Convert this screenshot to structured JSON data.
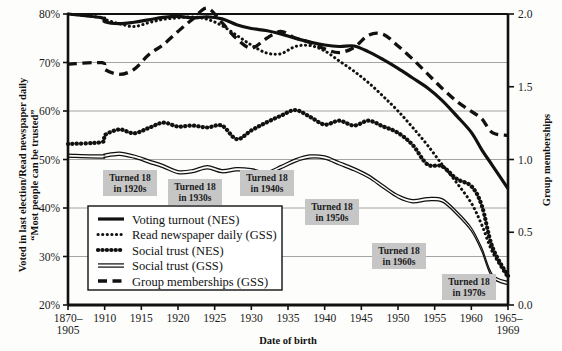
{
  "chart_data": {
    "type": "line",
    "title": "",
    "xlabel": "Date of birth",
    "ylabel": "Voted in last election/Read newspaper daily “Most people can be trusted”",
    "y2label": "Group memberships",
    "categories": [
      "1870–1905",
      "1910",
      "1915",
      "1920",
      "1925",
      "1930",
      "1935",
      "1940",
      "1945",
      "1950",
      "1955",
      "1960",
      "1965–1969"
    ],
    "x_tick_labels": [
      "1870–\n1905",
      "1910",
      "1915",
      "1920",
      "1925",
      "1930",
      "1935",
      "1940",
      "1945",
      "1950",
      "1955",
      "1960",
      "1965–\n1969"
    ],
    "y_tick_labels": [
      "20%",
      "30%",
      "40%",
      "50%",
      "60%",
      "70%",
      "80%"
    ],
    "y2_tick_labels": [
      "0.0",
      "0.5",
      "1.0",
      "1.5",
      "2.0"
    ],
    "ylim": [
      20,
      80
    ],
    "y2lim": [
      0.0,
      2.0
    ],
    "grid": true,
    "legend_position": "lower-left-inside",
    "series": [
      {
        "name": "Voting turnout (NES)",
        "axis": "left",
        "style": "solid-thick",
        "x": [
          1870,
          1907,
          1910,
          1912,
          1914,
          1916,
          1918,
          1920,
          1922,
          1924,
          1926,
          1928,
          1930,
          1932,
          1934,
          1936,
          1938,
          1940,
          1942,
          1944,
          1946,
          1948,
          1950,
          1952,
          1954,
          1956,
          1958,
          1960,
          1962,
          1964,
          1967
        ],
        "values": [
          80.0,
          79.2,
          78.4,
          78.0,
          78.3,
          78.8,
          79.3,
          79.5,
          79.2,
          79.4,
          79.0,
          77.8,
          77.0,
          76.6,
          75.9,
          75.0,
          74.2,
          73.6,
          73.3,
          73.4,
          72.2,
          70.6,
          68.8,
          66.8,
          64.8,
          62.2,
          59.0,
          55.6,
          52.0,
          48.8,
          44.0
        ]
      },
      {
        "name": "Read newspaper daily (GSS)",
        "axis": "left",
        "style": "dotted-fine",
        "x": [
          1870,
          1907,
          1910,
          1912,
          1914,
          1916,
          1918,
          1920,
          1922,
          1924,
          1926,
          1928,
          1930,
          1932,
          1934,
          1936,
          1938,
          1940,
          1942,
          1944,
          1946,
          1948,
          1950,
          1952,
          1954,
          1956,
          1958,
          1960,
          1962,
          1964,
          1967
        ],
        "values": [
          80.0,
          79.3,
          78.9,
          78.0,
          77.4,
          78.2,
          78.9,
          79.2,
          79.4,
          78.9,
          77.6,
          75.6,
          73.6,
          72.0,
          71.8,
          73.3,
          73.5,
          72.4,
          70.3,
          68.2,
          65.8,
          63.0,
          60.0,
          56.6,
          53.0,
          49.0,
          45.2,
          41.0,
          36.5,
          31.0,
          25.5
        ]
      },
      {
        "name": "Social trust (NES)",
        "axis": "left",
        "style": "dotted-thick",
        "x": [
          1870,
          1907,
          1910,
          1912,
          1914,
          1916,
          1918,
          1920,
          1922,
          1924,
          1926,
          1928,
          1930,
          1932,
          1934,
          1936,
          1938,
          1940,
          1942,
          1944,
          1946,
          1948,
          1950,
          1952,
          1954,
          1956,
          1958,
          1960,
          1962,
          1964,
          1967
        ],
        "values": [
          53.2,
          53.6,
          55.0,
          56.2,
          55.4,
          56.5,
          57.6,
          56.8,
          57.0,
          56.6,
          57.0,
          54.2,
          56.0,
          57.6,
          59.0,
          60.2,
          58.8,
          57.2,
          58.0,
          57.0,
          58.0,
          56.8,
          55.5,
          53.0,
          49.0,
          48.6,
          46.0,
          44.5,
          40.5,
          32.0,
          26.0
        ]
      },
      {
        "name": "Social trust (GSS)",
        "axis": "left",
        "style": "double-line",
        "x": [
          1870,
          1907,
          1910,
          1912,
          1914,
          1916,
          1918,
          1920,
          1922,
          1924,
          1926,
          1928,
          1930,
          1932,
          1934,
          1936,
          1938,
          1940,
          1942,
          1944,
          1946,
          1948,
          1950,
          1952,
          1954,
          1956,
          1958,
          1960,
          1962,
          1964,
          1967
        ],
        "values": [
          50.8,
          50.6,
          50.8,
          51.2,
          50.6,
          49.6,
          48.6,
          47.4,
          47.6,
          48.4,
          47.6,
          48.0,
          47.8,
          47.2,
          48.4,
          49.8,
          50.6,
          50.4,
          49.2,
          48.0,
          46.5,
          44.4,
          42.4,
          41.4,
          41.8,
          41.6,
          39.0,
          35.6,
          31.4,
          26.0,
          24.5
        ]
      },
      {
        "name": "Group memberships (GSS)",
        "axis": "right",
        "style": "dashed-thick",
        "x": [
          1870,
          1907,
          1910,
          1912,
          1914,
          1916,
          1918,
          1920,
          1922,
          1924,
          1926,
          1928,
          1930,
          1932,
          1934,
          1936,
          1938,
          1940,
          1942,
          1944,
          1946,
          1948,
          1950,
          1952,
          1954,
          1956,
          1958,
          1960,
          1962,
          1964,
          1967
        ],
        "values": [
          1.655,
          1.665,
          1.62,
          1.585,
          1.62,
          1.72,
          1.79,
          1.88,
          1.965,
          2.04,
          1.94,
          1.83,
          1.765,
          1.83,
          1.88,
          1.835,
          1.805,
          1.76,
          1.735,
          1.77,
          1.855,
          1.86,
          1.78,
          1.69,
          1.59,
          1.49,
          1.4,
          1.33,
          1.28,
          1.185,
          1.165
        ]
      }
    ],
    "annotations": [
      {
        "label_line1": "Turned 18",
        "label_line2": "in 1920s",
        "x": 103,
        "y": 170
      },
      {
        "label_line1": "Turned 18",
        "label_line2": "in 1930s",
        "x": 168,
        "y": 179
      },
      {
        "label_line1": "Turned 18",
        "label_line2": "in 1940s",
        "x": 240,
        "y": 170
      },
      {
        "label_line1": "Turned 18",
        "label_line2": "in 1950s",
        "x": 305,
        "y": 199
      },
      {
        "label_line1": "Turned 18",
        "label_line2": "in 1960s",
        "x": 372,
        "y": 243
      },
      {
        "label_line1": "Turned 18",
        "label_line2": "in 1970s",
        "x": 442,
        "y": 274
      }
    ]
  },
  "axes": {
    "left_title": "Voted in last election/Read newspaper daily",
    "left_title_2": "“Most people can be trusted”",
    "right_title": "Group memberships",
    "bottom_title": "Date of birth"
  },
  "legend": {
    "items": [
      {
        "label": "Voting turnout (NES)",
        "style": "solid-thick"
      },
      {
        "label": "Read newspaper daily (GSS)",
        "style": "dotted-fine"
      },
      {
        "label": "Social trust (NES)",
        "style": "dotted-thick"
      },
      {
        "label": "Social trust (GSS)",
        "style": "double-line"
      },
      {
        "label": "Group memberships (GSS)",
        "style": "dashed-thick"
      }
    ]
  },
  "colors": {
    "ink": "#111111",
    "grid": "#9a9a9a",
    "annotation_bg": "#c6c6c6",
    "page_bg": "#fdfdfb"
  }
}
